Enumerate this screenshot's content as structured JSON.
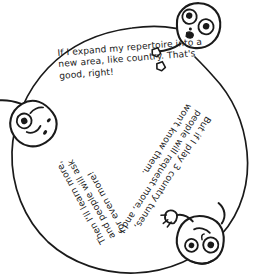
{
  "page": {
    "background_color": "#ffffff",
    "ink_color": "#1a1a1a",
    "width": 255,
    "height": 280
  },
  "diagram": {
    "type": "cycle",
    "shape": "hand-drawn circle",
    "circle": {
      "center_x": 128,
      "center_y": 150,
      "radius_x": 118,
      "radius_y": 122
    }
  },
  "texts": {
    "top": {
      "name": "expand-repertoire-statement",
      "rotation_deg": -4.5,
      "lines": [
        "If I expand my repertoire into a",
        "new area, like  country. That's",
        "good, right!"
      ]
    },
    "right": {
      "name": "request-more-statement",
      "rotation_deg": 123,
      "lines": [
        "But if I play 3 country tunes,",
        "people will request more, and I",
        "won't know them."
      ]
    },
    "bottom_left": {
      "name": "learn-more-statement",
      "rotation_deg": -119,
      "lines": [
        "Then I'll learn more,",
        "and people will ask",
        "for even more!"
      ]
    }
  },
  "figures": [
    {
      "name": "figure-top-right",
      "description": "cartoon head with wide eyes and small open mouth",
      "rotation_deg": 12,
      "x": 196,
      "y": 25
    },
    {
      "name": "figure-left",
      "description": "cartoon head tilted sideways on left edge of circle",
      "rotation_deg": 150,
      "x": 33,
      "y": 122
    },
    {
      "name": "figure-bottom-right",
      "description": "cartoon head with raised hand on lower right of circle",
      "rotation_deg": 205,
      "x": 203,
      "y": 240
    }
  ]
}
